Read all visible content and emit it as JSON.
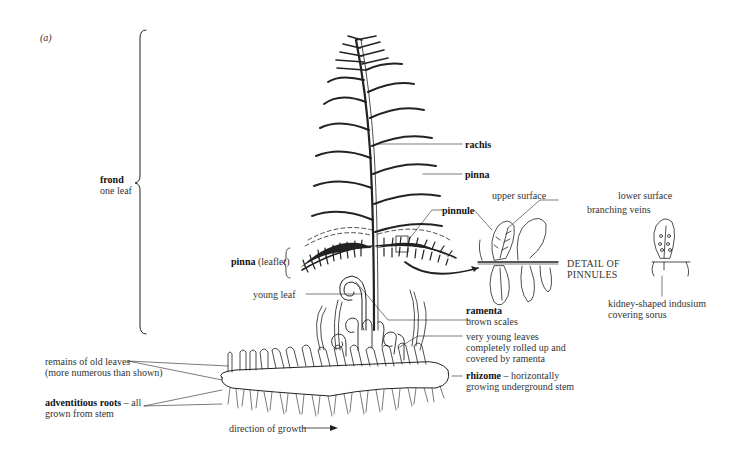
{
  "figure": {
    "panel_label": "(a)"
  },
  "labels": {
    "frond": {
      "term": "frond",
      "desc": "one leaf"
    },
    "rachis": {
      "term": "rachis"
    },
    "pinna": {
      "term": "pinna"
    },
    "pinna_leaflet": {
      "term": "pinna",
      "desc": "(leaflet)"
    },
    "pinnule": {
      "term": "pinnule"
    },
    "upper_surface": {
      "text": "upper surface"
    },
    "lower_surface": {
      "text": "lower surface"
    },
    "branching_veins": {
      "text": "branching veins"
    },
    "detail_of_pinnules": {
      "line1": "DETAIL OF",
      "line2": "PINNULES"
    },
    "indusium": {
      "line1": "kidney-shaped indusium",
      "line2": "covering sorus"
    },
    "young_leaf": {
      "text": "young leaf"
    },
    "ramenta": {
      "term": "ramenta",
      "desc": "brown scales"
    },
    "very_young_leaves": {
      "line1": "very young leaves",
      "line2": "completely rolled up and",
      "line3": "covered by ramenta"
    },
    "rhizome": {
      "term": "rhizome",
      "desc1": " – horizontally",
      "desc2": "growing underground stem"
    },
    "old_leaves": {
      "line1": "remains of old leaves",
      "line2": "(more numerous than shown)"
    },
    "adventitious_roots": {
      "term": "adventitious roots",
      "desc1": " – all",
      "desc2": "grown from stem"
    },
    "direction": {
      "text": "direction of growth"
    }
  }
}
